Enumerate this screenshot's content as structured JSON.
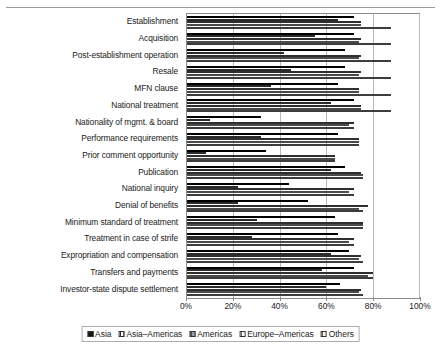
{
  "chart_data": {
    "type": "bar",
    "orientation": "horizontal",
    "grouping": "grouped",
    "title": "",
    "xlabel": "",
    "ylabel": "",
    "xlim": [
      0,
      100
    ],
    "xticks": [
      "0%",
      "20%",
      "40%",
      "60%",
      "80%",
      "100%"
    ],
    "xtick_values": [
      0,
      20,
      40,
      60,
      80,
      100
    ],
    "grid": true,
    "legend_position": "bottom",
    "categories": [
      "Establishment",
      "Acquisition",
      "Post-establishment operation",
      "Resale",
      "MFN clause",
      "National treatment",
      "Nationality of mgmt. & board",
      "Performance requirements",
      "Prior comment opportunity",
      "Publication",
      "National inquiry",
      "Denial of benefits",
      "Minimum standard of treatment",
      "Treatment in case of strife",
      "Expropriation and compensation",
      "Transfers and payments",
      "Investor-state dispute settlement"
    ],
    "series": [
      {
        "name": "Asia",
        "color": "#141414",
        "values": [
          72,
          72,
          68,
          68,
          65,
          72,
          32,
          65,
          34,
          68,
          44,
          52,
          64,
          65,
          70,
          72,
          66
        ]
      },
      {
        "name": "Asia-Americas",
        "color": "#ffffff",
        "values": [
          65,
          55,
          42,
          45,
          36,
          62,
          10,
          32,
          8,
          62,
          22,
          22,
          30,
          28,
          62,
          58,
          60
        ]
      },
      {
        "name": "Americas",
        "color": "#8f8f8f",
        "values": [
          75,
          75,
          75,
          75,
          74,
          75,
          72,
          74,
          64,
          75,
          72,
          78,
          76,
          72,
          75,
          80,
          75
        ]
      },
      {
        "name": "Europe-Americas",
        "color": "#ffffff",
        "values": [
          75,
          74,
          74,
          74,
          74,
          75,
          70,
          74,
          64,
          76,
          70,
          74,
          76,
          70,
          74,
          78,
          74
        ]
      },
      {
        "name": "Others",
        "color": "#f2f2f2",
        "values": [
          88,
          88,
          88,
          88,
          88,
          88,
          72,
          74,
          64,
          76,
          72,
          76,
          76,
          72,
          76,
          80,
          76
        ]
      }
    ]
  },
  "legend": {
    "items": [
      {
        "label": "Asia"
      },
      {
        "label": "Asia–Americas"
      },
      {
        "label": "Americas"
      },
      {
        "label": "Europe–Americas"
      },
      {
        "label": "Others"
      }
    ]
  }
}
